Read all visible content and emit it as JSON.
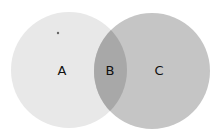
{
  "diagram": {
    "type": "venn",
    "regions": [
      {
        "id": "A",
        "label": "A",
        "color": "#e8e8e8"
      },
      {
        "id": "B",
        "label": "B",
        "color": "#a8a8a8"
      },
      {
        "id": "C",
        "label": "C",
        "color": "#c5c5c5"
      }
    ]
  }
}
